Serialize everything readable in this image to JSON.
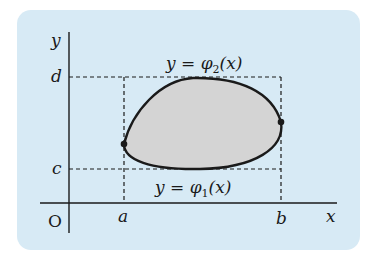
{
  "diagram": {
    "background_color": "#d7eaf5",
    "region_fill": "#d4d4d4",
    "stroke_color": "#1a1a1a",
    "axes": {
      "x_label": "x",
      "y_label": "y",
      "origin_label": "O"
    },
    "x_ticks": {
      "a": "a",
      "b": "b"
    },
    "y_ticks": {
      "c": "c",
      "d": "d"
    },
    "curves": {
      "upper": {
        "prefix": "y = φ",
        "subscript": "2",
        "suffix": "(x)"
      },
      "lower": {
        "prefix": "y = φ",
        "subscript": "1",
        "suffix": "(x)"
      }
    }
  }
}
